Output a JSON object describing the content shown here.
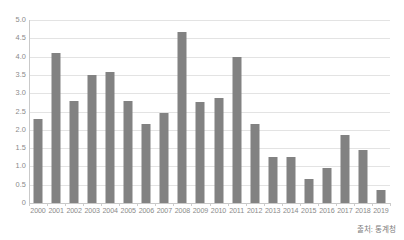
{
  "chart_data": {
    "type": "bar",
    "title": "",
    "subtitle": "",
    "xlabel": "",
    "ylabel": "",
    "categories": [
      "2000",
      "2001",
      "2002",
      "2003",
      "2004",
      "2005",
      "2006",
      "2007",
      "2008",
      "2009",
      "2010",
      "2011",
      "2012",
      "2013",
      "2014",
      "2015",
      "2016",
      "2017",
      "2018",
      "2019"
    ],
    "values": [
      2.3,
      4.1,
      2.8,
      3.5,
      3.58,
      2.78,
      2.17,
      2.47,
      4.67,
      2.76,
      2.87,
      3.98,
      2.16,
      1.27,
      1.27,
      0.65,
      0.96,
      1.85,
      1.46,
      0.35
    ],
    "ylim": [
      0,
      5.0
    ],
    "y_ticks": [
      "0",
      "0.5",
      "1.0",
      "1.5",
      "2.0",
      "2.5",
      "3.0",
      "3.5",
      "4.0",
      "4.5",
      "5.0"
    ],
    "y_tick_values": [
      0,
      0.5,
      1.0,
      1.5,
      2.0,
      2.5,
      3.0,
      3.5,
      4.0,
      4.5,
      5.0
    ],
    "grid": true,
    "legend": "none",
    "bar_color": "#828282",
    "gridline_color": "#e3e3e3",
    "axis_color": "#c9c9c9",
    "background_color": "#ffffff",
    "text_color": "#8a8a8a"
  },
  "footer": {
    "source_note": "출처: 통계청"
  }
}
